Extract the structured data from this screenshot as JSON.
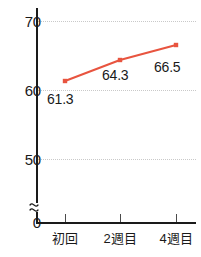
{
  "chart_data": {
    "type": "line",
    "title": "",
    "subtitle": "",
    "xlabel": "",
    "ylabel": "",
    "categories": [
      "初回",
      "2週目",
      "4週目"
    ],
    "values": [
      61.3,
      64.3,
      66.5
    ],
    "point_labels": [
      "61.3",
      "64.3",
      "66.5"
    ],
    "series": [
      {
        "name": "",
        "values": [
          61.3,
          64.3,
          66.5
        ],
        "color": "#e8543f",
        "marker": "square"
      }
    ],
    "ylim": [
      0,
      70
    ],
    "y_ticks": [
      0,
      50,
      60,
      70
    ],
    "y_tick_labels": [
      "0",
      "50",
      "60",
      "70"
    ],
    "axis_break": true,
    "axis_break_between": [
      0,
      50
    ],
    "grid": true,
    "grid_axis": "y",
    "grid_style": "dotted",
    "grid_color": "#c9c9c9",
    "legend": null,
    "legend_position": "none",
    "axis_color": "#1a1a1a"
  },
  "y_axis": {
    "ticks": [
      {
        "label": "70",
        "top": 14
      },
      {
        "label": "60",
        "top": 83
      },
      {
        "label": "50",
        "top": 152
      },
      {
        "label": "0",
        "top": 215
      }
    ]
  },
  "x_axis": {
    "ticks": [
      {
        "label": "初回",
        "x": 65
      },
      {
        "label": "2週目",
        "x": 120
      },
      {
        "label": "4週目",
        "x": 176
      }
    ]
  },
  "points": [
    {
      "label": "61.3",
      "cx": 65,
      "cy": 81,
      "label_left": 47,
      "label_top": 92
    },
    {
      "label": "64.3",
      "cx": 120,
      "cy": 60,
      "label_left": 102,
      "label_top": 68
    },
    {
      "label": "66.5",
      "cx": 176,
      "cy": 45,
      "label_left": 154,
      "label_top": 60
    }
  ],
  "gridlines": [
    {
      "top": 21
    },
    {
      "top": 90
    },
    {
      "top": 159
    }
  ]
}
